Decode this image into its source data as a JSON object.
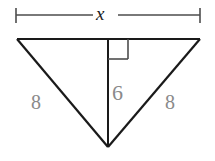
{
  "figure": {
    "kind": "geometry-diagram",
    "background_color": "#ffffff",
    "stroke_color": "#1a1a1a",
    "dimension_line_color": "#4d4d4d",
    "label_color_primary": "#1a1a1a",
    "label_color_secondary": "#8a8a8a"
  },
  "dimension": {
    "label": "x",
    "name": "base-width",
    "line_y": 15,
    "left_tick_x": 16,
    "right_tick_x": 200,
    "tick_half_height": 7
  },
  "triangle": {
    "vertices": {
      "top_left": {
        "x": 17,
        "y": 39
      },
      "top_right": {
        "x": 200,
        "y": 39
      },
      "apex_bottom": {
        "x": 108,
        "y": 147
      }
    },
    "legs": [
      {
        "name": "left-leg",
        "label": "8"
      },
      {
        "name": "right-leg",
        "label": "8"
      }
    ],
    "base": {
      "name": "top-base",
      "label": "x"
    }
  },
  "altitude": {
    "label": "6",
    "from": {
      "x": 108,
      "y": 39
    },
    "to": {
      "x": 108,
      "y": 147
    },
    "right_angle_marker": {
      "size": 20,
      "corner_x": 108,
      "corner_y": 39,
      "direction": "right-down"
    }
  },
  "labels": {
    "base": "x",
    "altitude": "6",
    "leg_left": "8",
    "leg_right": "8"
  }
}
